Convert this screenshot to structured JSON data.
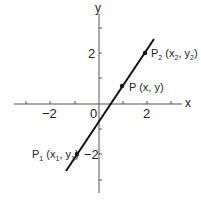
{
  "axes": {
    "x_label": "x",
    "y_label": "y",
    "origin_label": "0",
    "x_tick_labels": [
      {
        "text": "−2",
        "value": -2
      },
      {
        "text": "2",
        "value": 2
      }
    ],
    "y_tick_labels": [
      {
        "text": "2",
        "value": 2
      },
      {
        "text": "−2",
        "value": -2
      }
    ]
  },
  "points": {
    "p1": {
      "name": "P",
      "sub": "1",
      "open": " (x",
      "xsub": "1",
      "mid": ", y",
      "ysub": "1",
      "close": ")"
    },
    "p": {
      "text": "P (x, y)"
    },
    "p2": {
      "name": "P",
      "sub": "2",
      "open": " (x",
      "xsub": "2",
      "mid": ", y",
      "ysub": "2",
      "close": ")"
    }
  },
  "colors": {
    "line": "#111111",
    "axis": "#555555"
  }
}
